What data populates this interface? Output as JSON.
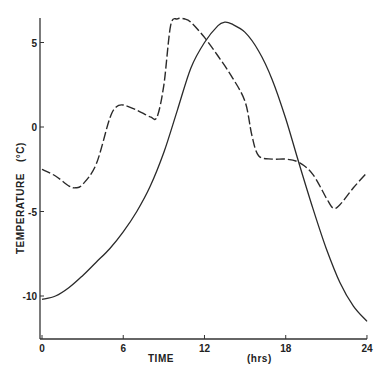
{
  "chart_data": {
    "type": "line",
    "title": "",
    "xlabel": "TIME",
    "xunit": "(hrs)",
    "ylabel": "TEMPERATURE",
    "yunit": "(°C)",
    "xlim": [
      0,
      24
    ],
    "ylim": [
      -12.5,
      6.5
    ],
    "x_ticks": [
      0,
      6,
      12,
      18,
      24
    ],
    "y_ticks": [
      5,
      0,
      -5,
      -10
    ],
    "x_tick_labels": [
      "0",
      "6",
      "12",
      "18",
      "24"
    ],
    "y_tick_labels": [
      "5",
      "0",
      "-5",
      "-10"
    ],
    "grid": false,
    "legend": null,
    "series": [
      {
        "name": "solid",
        "style": "solid",
        "x": [
          0,
          1,
          2,
          3,
          4,
          5,
          6,
          7,
          8,
          9,
          10,
          11,
          12,
          13,
          13.5,
          14,
          15,
          16,
          17,
          18,
          19,
          20,
          21,
          22,
          23,
          24
        ],
        "values": [
          -10.2,
          -10.0,
          -9.5,
          -8.8,
          -8.0,
          -7.2,
          -6.2,
          -5.0,
          -3.5,
          -1.5,
          1.0,
          3.5,
          5.0,
          6.0,
          6.2,
          6.1,
          5.6,
          4.5,
          2.8,
          0.5,
          -2.2,
          -4.8,
          -7.2,
          -9.2,
          -10.6,
          -11.5
        ]
      },
      {
        "name": "dashed",
        "style": "dashed",
        "x": [
          0,
          1,
          2,
          2.5,
          3,
          4,
          5,
          5.5,
          6,
          7,
          8,
          8.5,
          9,
          9.5,
          10,
          10.5,
          11,
          12,
          13,
          14,
          15,
          15.5,
          16,
          17,
          18,
          19,
          20,
          21,
          21.5,
          22,
          23,
          24
        ],
        "values": [
          -2.5,
          -2.9,
          -3.5,
          -3.6,
          -3.4,
          -2.2,
          0.5,
          1.2,
          1.3,
          1.0,
          0.6,
          0.6,
          2.5,
          6.0,
          6.4,
          6.4,
          6.2,
          5.3,
          4.2,
          3.0,
          1.5,
          -0.5,
          -1.7,
          -1.9,
          -1.9,
          -2.1,
          -2.8,
          -4.2,
          -4.8,
          -4.6,
          -3.6,
          -2.7
        ]
      }
    ]
  },
  "labels": {
    "x_axis_title": "TIME",
    "x_axis_unit": "(hrs)",
    "y_axis_title": "TEMPERATURE",
    "y_axis_unit": "(°C)"
  },
  "colors": {
    "axis": "#333333",
    "line": "#2a2a2a",
    "background": "#ffffff"
  }
}
